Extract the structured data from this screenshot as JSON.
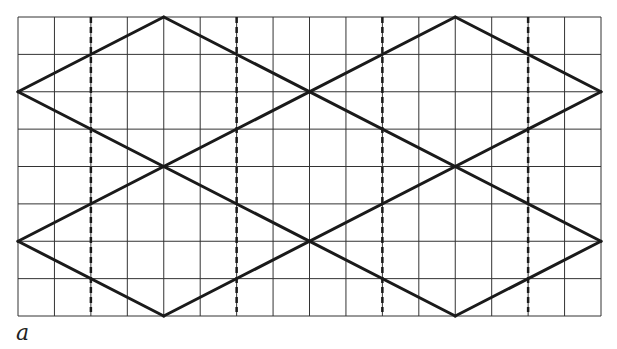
{
  "figure": {
    "label": "a",
    "grid": {
      "columns": 16,
      "rows": 8,
      "left": 18,
      "top": 17,
      "right": 601,
      "bottom": 316,
      "line_color": "#333333",
      "line_width": 1
    },
    "solid_lines": {
      "color": "#1a1a1a",
      "width": 3,
      "segments": [
        [
          [
            0,
            2
          ],
          [
            4,
            0
          ]
        ],
        [
          [
            4,
            0
          ],
          [
            16,
            6
          ]
        ],
        [
          [
            0,
            2
          ],
          [
            12,
            8
          ]
        ],
        [
          [
            0,
            6
          ],
          [
            12,
            0
          ]
        ],
        [
          [
            12,
            0
          ],
          [
            16,
            2
          ]
        ],
        [
          [
            0,
            6
          ],
          [
            4,
            8
          ]
        ],
        [
          [
            4,
            8
          ],
          [
            16,
            2
          ]
        ],
        [
          [
            12,
            8
          ],
          [
            16,
            6
          ]
        ]
      ]
    },
    "dashed_lines": {
      "color": "#1a1a1a",
      "width": 2.5,
      "dash": "6 4",
      "columns": [
        2,
        6,
        10,
        14
      ],
      "y_start": 17,
      "y_end": 312
    }
  }
}
